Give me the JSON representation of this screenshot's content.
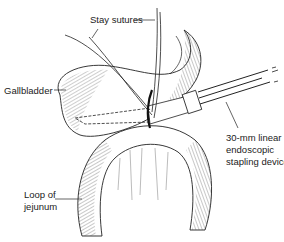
{
  "figure": {
    "type": "surgical line-art illustration",
    "colors": {
      "line": "#222222",
      "background": "#ffffff"
    }
  },
  "labels": {
    "stay_sutures": "Stay sutures",
    "gallbladder": "Gallbladder",
    "loop_of_jejunum_line1": "Loop of",
    "loop_of_jejunum_line2": "jejunum",
    "device_line1": "30-mm linear",
    "device_line2": "endoscopic",
    "device_line3": "stapling device"
  }
}
